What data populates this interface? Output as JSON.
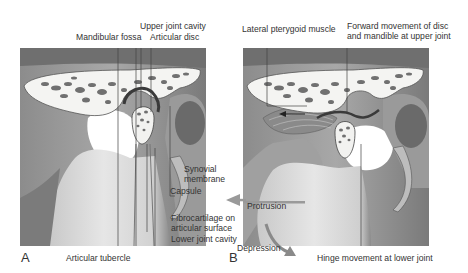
{
  "figure": {
    "panels": [
      {
        "id": "A",
        "letter": "A",
        "labels": {
          "mandibular_fossa": "Mandibular fossa",
          "upper_joint_cavity": "Upper joint cavity",
          "articular_disc": "Articular disc",
          "synovial_membrane_1": "Synovial",
          "synovial_membrane_2": "membrane",
          "capsule": "Capsule",
          "fibrocartilage_1": "Fibrocartilage on",
          "fibrocartilage_2": "articular surface",
          "lower_joint_cavity": "Lower joint cavity",
          "articular_tubercle": "Articular tubercle"
        }
      },
      {
        "id": "B",
        "letter": "B",
        "labels": {
          "lateral_pterygoid": "Lateral pterygoid muscle",
          "forward_movement_1": "Forward movement of disc",
          "forward_movement_2": "and mandible at upper joint",
          "protrusion": "Protrusion",
          "depression": "Depression",
          "hinge_movement": "Hinge movement at lower joint"
        }
      }
    ],
    "colors": {
      "background": "#ffffff",
      "bone_light": "#f4f4f2",
      "bone_mid": "#b8b8b8",
      "bone_dark": "#5a5a5a",
      "trabeculae": "#6e6e6e",
      "leader_line": "#444444",
      "arrow": "#9a9a9a"
    }
  }
}
